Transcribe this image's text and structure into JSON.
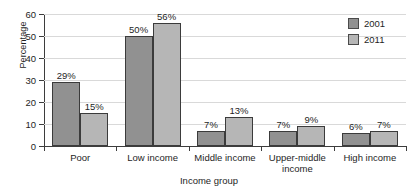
{
  "chart_data": {
    "type": "bar",
    "title": "",
    "xlabel": "Income group",
    "ylabel": "Percentage",
    "ylim": [
      0,
      60
    ],
    "yticks": [
      0,
      10,
      20,
      30,
      40,
      50,
      60
    ],
    "grid": true,
    "legend_position": "top-right",
    "categories": [
      "Poor",
      "Low income",
      "Middle income",
      "Upper-middle income",
      "High income"
    ],
    "series": [
      {
        "name": "2001",
        "color": "#919191",
        "values": [
          29,
          50,
          7,
          7,
          6
        ],
        "labels": [
          "29%",
          "50%",
          "7%",
          "7%",
          "6%"
        ]
      },
      {
        "name": "2011",
        "color": "#b6b6b6",
        "values": [
          15,
          56,
          13,
          9,
          7
        ],
        "labels": [
          "15%",
          "56%",
          "13%",
          "9%",
          "7%"
        ]
      }
    ]
  }
}
